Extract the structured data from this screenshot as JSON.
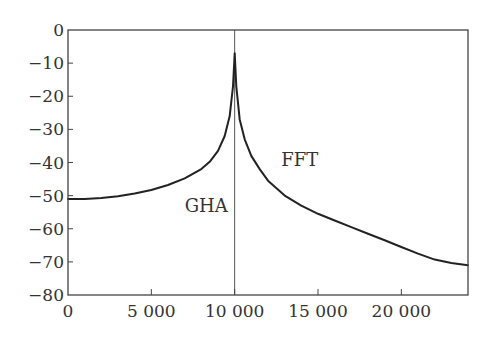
{
  "chart_data": {
    "type": "line",
    "title": "",
    "xlabel": "",
    "ylabel": "",
    "xlim": [
      0,
      24000
    ],
    "ylim": [
      -80,
      0
    ],
    "grid": false,
    "legend": "none",
    "x_ticks": [
      0,
      5000,
      10000,
      15000,
      20000
    ],
    "x_tick_labels": [
      "0",
      "5 000",
      "10 000",
      "15 000",
      "20 000"
    ],
    "y_ticks": [
      0,
      -10,
      -20,
      -30,
      -40,
      -50,
      -60,
      -70,
      -80
    ],
    "y_tick_labels": [
      "0",
      "−10",
      "−20",
      "−30",
      "−40",
      "−50",
      "−60",
      "−70",
      "−80"
    ],
    "annotations": [
      {
        "text": "GHA",
        "x": 7000,
        "y": -55
      },
      {
        "text": "FFT",
        "x": 12800,
        "y": -41
      }
    ],
    "vertical_line": {
      "x": 10000
    },
    "series": [
      {
        "name": "spectrum",
        "x": [
          0,
          1000,
          2000,
          3000,
          4000,
          5000,
          6000,
          7000,
          8000,
          8500,
          9000,
          9400,
          9700,
          9900,
          10000,
          10100,
          10300,
          10600,
          11000,
          11500,
          12000,
          13000,
          14000,
          15000,
          16000,
          17000,
          18000,
          19000,
          20000,
          21000,
          22000,
          23000,
          24000
        ],
        "values": [
          -51,
          -51,
          -50.7,
          -50.2,
          -49.4,
          -48.3,
          -46.8,
          -44.8,
          -42,
          -39.8,
          -36.5,
          -32,
          -26,
          -17,
          -7,
          -17,
          -27,
          -33,
          -38,
          -42,
          -45.5,
          -50,
          -53,
          -55.5,
          -57.5,
          -59.5,
          -61.5,
          -63.5,
          -65.5,
          -67.5,
          -69.3,
          -70.3,
          -71
        ]
      }
    ]
  },
  "plot": {
    "frame": {
      "left": 68,
      "top": 30,
      "right": 468,
      "bottom": 295
    },
    "line_color": "#222222",
    "axis_color": "#444444",
    "vline_color": "#555555"
  }
}
